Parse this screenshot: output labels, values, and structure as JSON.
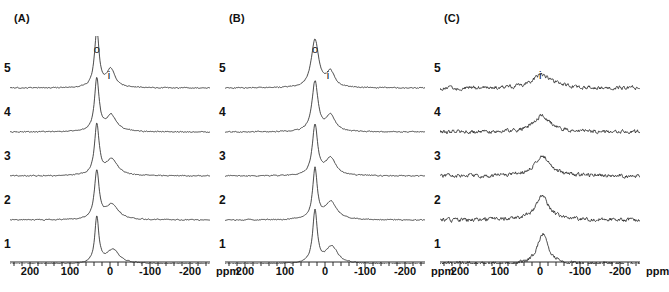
{
  "figure": {
    "width": 657,
    "height": 292,
    "background": "#ffffff",
    "line_color": "#2b2b2b",
    "text_color": "#111111"
  },
  "chart_data": {
    "type": "line",
    "title": "",
    "xlabel": "ppm",
    "ylabel": "",
    "xlim": [
      250,
      -250
    ],
    "x_reversed": true,
    "grid": false,
    "legend": "none",
    "axis": {
      "unit": "ppm",
      "tick_labels": [
        "200",
        "100",
        "0",
        "-100",
        "-200"
      ],
      "tick_values": [
        200,
        100,
        0,
        -100,
        -200
      ],
      "minor_tick_step": 20,
      "minor_tick_count": 26
    },
    "panels": [
      {
        "id": "A",
        "label": "(A)",
        "trace_labels": [
          "5",
          "4",
          "3",
          "2",
          "1"
        ],
        "peak_annotations": [
          {
            "label": "o",
            "ppm": 33,
            "note": "outer / surface site"
          },
          {
            "label": "i",
            "ppm": -2,
            "note": "inner site"
          }
        ],
        "noise_amplitude": 0.9,
        "traces": [
          {
            "name": "5",
            "peaks": [
              {
                "label": "o",
                "center": 33,
                "height": 56,
                "width": 7
              },
              {
                "label": "i",
                "center": -2,
                "height": 18,
                "width": 13
              }
            ]
          },
          {
            "name": "4",
            "peaks": [
              {
                "label": "o",
                "center": 33,
                "height": 52,
                "width": 7
              },
              {
                "label": "i",
                "center": -3,
                "height": 16,
                "width": 16
              }
            ]
          },
          {
            "name": "3",
            "peaks": [
              {
                "label": "o",
                "center": 33,
                "height": 50,
                "width": 7
              },
              {
                "label": "i",
                "center": -4,
                "height": 16,
                "width": 18
              }
            ]
          },
          {
            "name": "2",
            "peaks": [
              {
                "label": "o",
                "center": 33,
                "height": 48,
                "width": 7
              },
              {
                "label": "i",
                "center": -5,
                "height": 15,
                "width": 19
              }
            ]
          },
          {
            "name": "1",
            "peaks": [
              {
                "label": "o",
                "center": 33,
                "height": 46,
                "width": 6
              },
              {
                "label": "i",
                "center": -7,
                "height": 14,
                "width": 20
              }
            ]
          }
        ]
      },
      {
        "id": "B",
        "label": "(B)",
        "trace_labels": [
          "5",
          "4",
          "3",
          "2",
          "1"
        ],
        "peak_annotations": [
          {
            "label": "o",
            "ppm": 25,
            "note": "outer / surface site"
          },
          {
            "label": "i",
            "ppm": -12,
            "note": "inner site"
          }
        ],
        "noise_amplitude": 0.9,
        "traces": [
          {
            "name": "5",
            "peaks": [
              {
                "label": "o",
                "center": 25,
                "height": 48,
                "width": 11
              },
              {
                "label": "i",
                "center": -14,
                "height": 15,
                "width": 12
              }
            ]
          },
          {
            "name": "4",
            "peaks": [
              {
                "label": "o",
                "center": 25,
                "height": 50,
                "width": 9
              },
              {
                "label": "i",
                "center": -14,
                "height": 16,
                "width": 14
              }
            ]
          },
          {
            "name": "3",
            "peaks": [
              {
                "label": "o",
                "center": 25,
                "height": 50,
                "width": 8
              },
              {
                "label": "i",
                "center": -14,
                "height": 17,
                "width": 16
              }
            ]
          },
          {
            "name": "2",
            "peaks": [
              {
                "label": "o",
                "center": 25,
                "height": 50,
                "width": 7
              },
              {
                "label": "i",
                "center": -15,
                "height": 18,
                "width": 17
              }
            ]
          },
          {
            "name": "1",
            "peaks": [
              {
                "label": "o",
                "center": 25,
                "height": 52,
                "width": 7
              },
              {
                "label": "i",
                "center": -17,
                "height": 17,
                "width": 18
              }
            ]
          }
        ]
      },
      {
        "id": "C",
        "label": "(C)",
        "trace_labels": [
          "5",
          "4",
          "3",
          "2",
          "1"
        ],
        "peak_annotations": [
          {
            "label": "i",
            "ppm": -5,
            "note": "inner site"
          }
        ],
        "noise_amplitude": 3.4,
        "traces": [
          {
            "name": "5",
            "peaks": [
              {
                "label": "i",
                "center": -5,
                "height": 13,
                "width": 30
              }
            ]
          },
          {
            "name": "4",
            "peaks": [
              {
                "label": "i",
                "center": -5,
                "height": 16,
                "width": 26
              }
            ]
          },
          {
            "name": "3",
            "peaks": [
              {
                "label": "i",
                "center": -6,
                "height": 20,
                "width": 24
              }
            ]
          },
          {
            "name": "2",
            "peaks": [
              {
                "label": "i",
                "center": -6,
                "height": 24,
                "width": 20
              }
            ]
          },
          {
            "name": "1",
            "peaks": [
              {
                "label": "i",
                "center": -7,
                "height": 30,
                "width": 16
              }
            ]
          }
        ]
      }
    ]
  }
}
